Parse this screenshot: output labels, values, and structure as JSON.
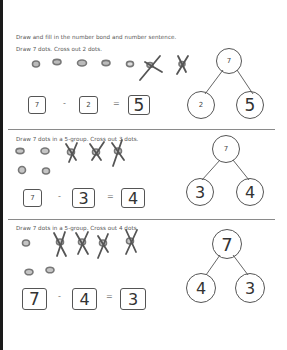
{
  "worksheet": {
    "instruction": "Draw and fill in the number bond and number sentence.",
    "problems": [
      {
        "prompt": "Draw 7 dots.  Cross out 2 dots.",
        "sentence": {
          "a": "7",
          "op": "-",
          "b": "2",
          "eq": "=",
          "result": "5"
        },
        "bond": {
          "whole": "7",
          "part1": "2",
          "part2": "5"
        },
        "dots_total": 7,
        "dots_crossed": 2
      },
      {
        "prompt": "Draw 7 dots in a 5-group.  Cross out 3 dots.",
        "sentence": {
          "a": "7",
          "op": "-",
          "b": "3",
          "eq": "=",
          "result": "4"
        },
        "bond": {
          "whole": "7",
          "part1": "3",
          "part2": "4"
        },
        "dots_total": 7,
        "dots_crossed": 3
      },
      {
        "prompt": "Draw 7 dots in a 5-group.  Cross out 4 dots.",
        "sentence": {
          "a": "7",
          "op": "-",
          "b": "4",
          "eq": "=",
          "result": "3"
        },
        "bond": {
          "whole": "7",
          "part1": "4",
          "part2": "3"
        },
        "dots_total": 7,
        "dots_crossed": 4
      }
    ]
  }
}
